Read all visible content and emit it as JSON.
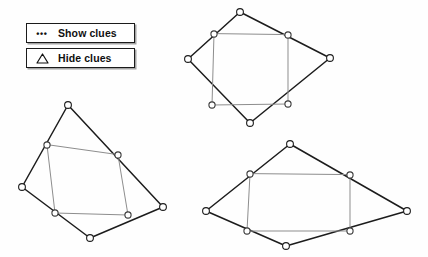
{
  "page": {
    "background_color": "#fefefe",
    "width": 428,
    "height": 257
  },
  "toolbar": {
    "buttons": [
      {
        "id": "show-clues",
        "label": "Show clues",
        "icon": "three-dots-icon",
        "icon_glyph": "•••",
        "text_color": "#101010",
        "border_color": "#1b1b1b",
        "background_color": "#ffffff"
      },
      {
        "id": "hide-clues",
        "label": "Hide clues",
        "icon": "triangle-outline-icon",
        "icon_glyph": "triangle",
        "text_color": "#101010",
        "border_color": "#1b1b1b",
        "background_color": "#ffffff"
      }
    ]
  },
  "colors": {
    "outer_edge": "#1c1c1c",
    "inner_edge": "#8d8d8d",
    "vertex_fill": "#ffffff",
    "vertex_stroke": "#1d1d1d"
  },
  "chart_data": {
    "type": "diagram",
    "figures": [
      {
        "name": "top-quadrilateral",
        "inner_shape": "square",
        "outer_vertices": [
          {
            "label": "A",
            "x": 240,
            "y": 12
          },
          {
            "label": "B",
            "x": 330,
            "y": 58
          },
          {
            "label": "C",
            "x": 250,
            "y": 123
          },
          {
            "label": "D",
            "x": 188,
            "y": 59
          }
        ],
        "midpoints": [
          {
            "label": "M-AB",
            "x": 288,
            "y": 35
          },
          {
            "label": "M-BC",
            "x": 288,
            "y": 104
          },
          {
            "label": "M-CD",
            "x": 212,
            "y": 105
          },
          {
            "label": "M-DA",
            "x": 214,
            "y": 34
          }
        ]
      },
      {
        "name": "bottom-left-quadrilateral",
        "inner_shape": "parallelogram",
        "outer_vertices": [
          {
            "label": "A",
            "x": 68,
            "y": 105
          },
          {
            "label": "B",
            "x": 163,
            "y": 207
          },
          {
            "label": "C",
            "x": 90,
            "y": 238
          },
          {
            "label": "D",
            "x": 22,
            "y": 187
          }
        ],
        "midpoints": [
          {
            "label": "M-AB",
            "x": 118,
            "y": 155
          },
          {
            "label": "M-BC",
            "x": 128,
            "y": 215
          },
          {
            "label": "M-CD",
            "x": 55,
            "y": 213
          },
          {
            "label": "M-DA",
            "x": 47,
            "y": 145
          }
        ]
      },
      {
        "name": "bottom-right-quadrilateral",
        "inner_shape": "rectangle",
        "outer_vertices": [
          {
            "label": "A",
            "x": 290,
            "y": 144
          },
          {
            "label": "B",
            "x": 407,
            "y": 211
          },
          {
            "label": "C",
            "x": 286,
            "y": 246
          },
          {
            "label": "D",
            "x": 206,
            "y": 211
          }
        ],
        "midpoints": [
          {
            "label": "M-AB",
            "x": 350,
            "y": 175
          },
          {
            "label": "M-BC",
            "x": 350,
            "y": 231
          },
          {
            "label": "M-CD",
            "x": 247,
            "y": 231
          },
          {
            "label": "M-DA",
            "x": 250,
            "y": 174
          }
        ]
      }
    ]
  }
}
